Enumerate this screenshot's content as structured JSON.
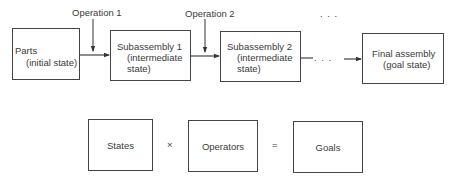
{
  "process": {
    "operations": [
      {
        "label": "Operation 1"
      },
      {
        "label": "Operation 2"
      }
    ],
    "ellipsis": ". . .",
    "states": [
      {
        "title": "Parts",
        "subtitle": "(initial state)"
      },
      {
        "title": "Subassembly 1",
        "subtitle_line1": "(intermediate",
        "subtitle_line2": "state)"
      },
      {
        "title": "Subassembly 2",
        "subtitle_line1": "(intermediate",
        "subtitle_line2": "state)"
      },
      {
        "title": "Final assembly",
        "subtitle": "(goal state)"
      }
    ]
  },
  "equation": {
    "states": "States",
    "times": "×",
    "operators": "Operators",
    "equals": "=",
    "goals": "Goals"
  }
}
